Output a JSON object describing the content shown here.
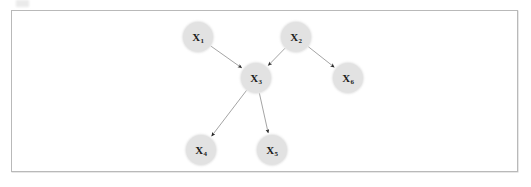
{
  "figure": {
    "type": "directed-acyclic-graph",
    "frame": {
      "border_color": "#b9b9b9",
      "background_color": "#ffffff"
    },
    "node_style": {
      "fill_color": "#e2e2e2",
      "label_color": "#1c1c1c",
      "diameter": 30
    },
    "edge_style": {
      "line_color": "#9a9a9a",
      "arrowhead_color": "#2b2b2b"
    },
    "nodes": [
      {
        "id": "X1",
        "variable": "X",
        "subscript": "1",
        "x": 198,
        "y": 37
      },
      {
        "id": "X2",
        "variable": "X",
        "subscript": "2",
        "x": 296,
        "y": 37
      },
      {
        "id": "X3",
        "variable": "X",
        "subscript": "3",
        "x": 256,
        "y": 78
      },
      {
        "id": "X6",
        "variable": "X",
        "subscript": "6",
        "x": 348,
        "y": 78
      },
      {
        "id": "X4",
        "variable": "X",
        "subscript": "4",
        "x": 201,
        "y": 150
      },
      {
        "id": "X5",
        "variable": "X",
        "subscript": "5",
        "x": 272,
        "y": 150
      }
    ],
    "edges": [
      {
        "from": "X1",
        "to": "X3"
      },
      {
        "from": "X2",
        "to": "X3"
      },
      {
        "from": "X2",
        "to": "X6"
      },
      {
        "from": "X3",
        "to": "X4"
      },
      {
        "from": "X3",
        "to": "X5"
      }
    ]
  }
}
